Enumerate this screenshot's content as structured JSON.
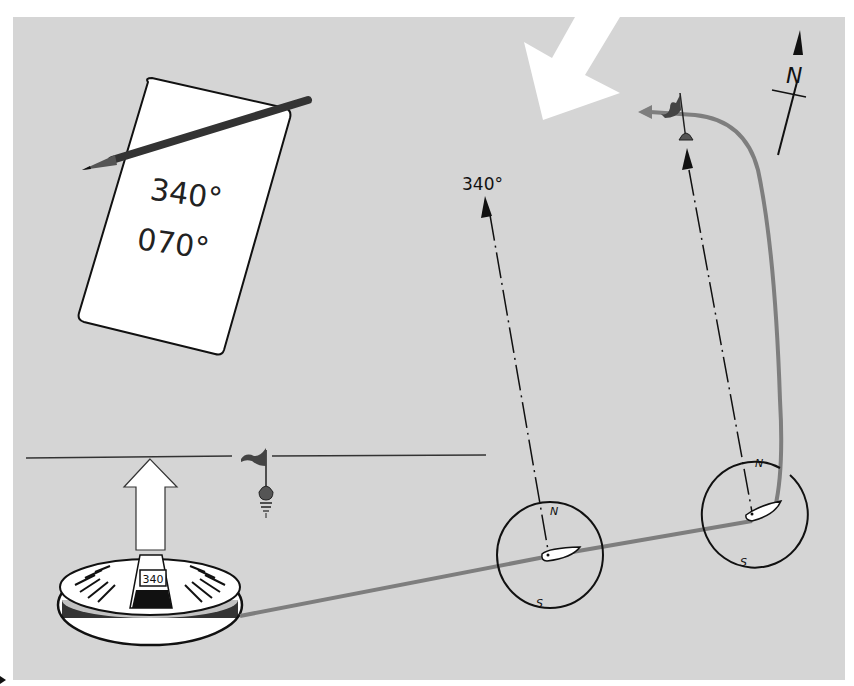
{
  "figure": {
    "type": "compass-navigation-illustration",
    "background_color": "#d5d5d5"
  },
  "note_card": {
    "bearing_1": "340°",
    "bearing_2": "070°"
  },
  "bearing_label": {
    "text": "340°"
  },
  "hand_compass": {
    "window_reading": "340"
  },
  "north_arrow": {
    "label": "N"
  },
  "compass_circles": [
    {
      "north_label": "N",
      "south_label": "S"
    },
    {
      "north_label": "N",
      "south_label": "S"
    }
  ],
  "colors": {
    "ink": "#111111",
    "track_gray": "#808080",
    "card_white": "#ffffff",
    "flag_dark": "#444444"
  }
}
